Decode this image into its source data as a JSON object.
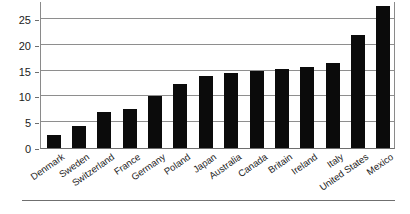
{
  "chart_data": {
    "type": "bar",
    "title": "",
    "subtitle": "",
    "xlabel": "",
    "ylabel": "",
    "categories": [
      "Denmark",
      "Sweden",
      "Switzerland",
      "France",
      "Germany",
      "Poland",
      "Japan",
      "Australia",
      "Canada",
      "Britain",
      "Ireland",
      "Italy",
      "United States",
      "Mexico"
    ],
    "values": [
      2.5,
      4.2,
      7.0,
      7.6,
      10.1,
      12.5,
      14.0,
      14.6,
      15.0,
      15.3,
      15.8,
      16.5,
      22.0,
      27.5
    ],
    "ylim": [
      0,
      28.5
    ],
    "yticks": [
      0,
      5,
      10,
      15,
      20,
      25
    ],
    "ytick_labels": [
      "0",
      "5",
      "10",
      "15",
      "20",
      "25"
    ],
    "grid": true,
    "legend": false,
    "legend_position": "none",
    "bar_color": "#0b0b0b",
    "gridline_color": "#8e8e8e",
    "axis_color": "#6e6e6e",
    "background_color": "#ffffff",
    "annotations": []
  },
  "footer": {
    "rule_visible": true
  }
}
